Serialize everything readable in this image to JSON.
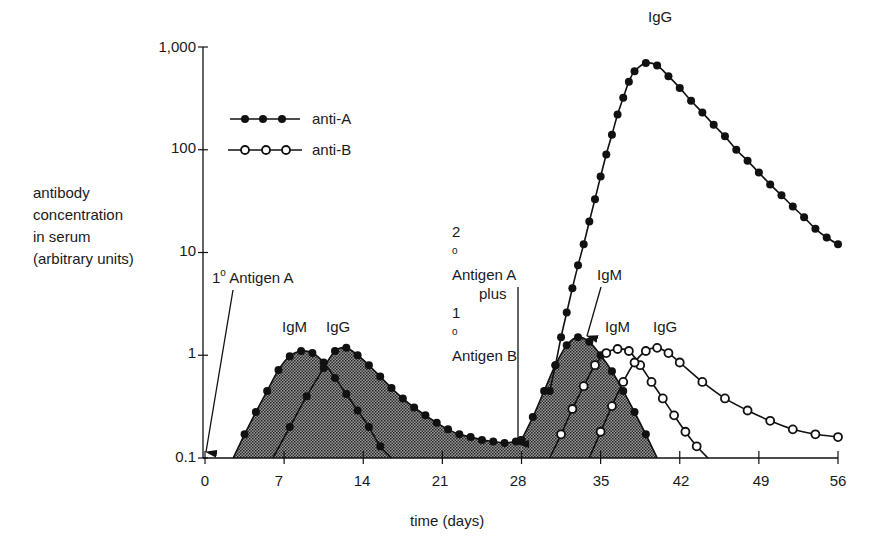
{
  "chart_data": {
    "type": "line",
    "title": "",
    "xlabel": "time (days)",
    "ylabel": "antibody concentration in serum (arbitrary units)",
    "yscale": "log",
    "ylim": [
      0.1,
      1000
    ],
    "xlim": [
      0,
      56
    ],
    "x_ticks": [
      0,
      7,
      14,
      21,
      28,
      35,
      42,
      49,
      56
    ],
    "y_ticks": [
      0.1,
      1,
      10,
      100,
      1000
    ],
    "y_tick_labels": [
      "0.1",
      "1",
      "10",
      "100",
      "1,000"
    ],
    "grid": false,
    "legend": {
      "position": "upper-left",
      "entries": [
        "anti-A",
        "anti-B"
      ]
    },
    "series": [
      {
        "name": "anti-A IgM (primary)",
        "marker": "filled-circle",
        "shaded": true,
        "points": [
          [
            2.5,
            0.1
          ],
          [
            3.5,
            0.17
          ],
          [
            4.5,
            0.28
          ],
          [
            5.5,
            0.45
          ],
          [
            6.5,
            0.72
          ],
          [
            7.5,
            0.98
          ],
          [
            8.5,
            1.1
          ],
          [
            9.5,
            1.05
          ],
          [
            10.5,
            0.85
          ],
          [
            11.5,
            0.6
          ],
          [
            12.5,
            0.42
          ],
          [
            13.5,
            0.29
          ],
          [
            14.5,
            0.2
          ],
          [
            15.5,
            0.13
          ],
          [
            16.5,
            0.1
          ]
        ]
      },
      {
        "name": "anti-A IgG (primary)",
        "marker": "filled-circle",
        "shaded": true,
        "points": [
          [
            6,
            0.1
          ],
          [
            7.5,
            0.2
          ],
          [
            9,
            0.4
          ],
          [
            10.5,
            0.75
          ],
          [
            11.5,
            1.1
          ],
          [
            12.5,
            1.18
          ],
          [
            13.5,
            1.0
          ],
          [
            14.5,
            0.8
          ],
          [
            15.5,
            0.62
          ],
          [
            16.5,
            0.48
          ],
          [
            17.5,
            0.38
          ],
          [
            18.5,
            0.31
          ],
          [
            19.5,
            0.26
          ],
          [
            20.5,
            0.22
          ],
          [
            21.5,
            0.19
          ],
          [
            22.5,
            0.17
          ],
          [
            23.5,
            0.16
          ],
          [
            24.5,
            0.15
          ],
          [
            25.5,
            0.145
          ],
          [
            26.5,
            0.14
          ],
          [
            27.5,
            0.145
          ],
          [
            28,
            0.15
          ]
        ]
      },
      {
        "name": "anti-A IgM (secondary)",
        "marker": "filled-circle",
        "shaded": true,
        "points": [
          [
            28,
            0.15
          ],
          [
            29,
            0.25
          ],
          [
            30,
            0.45
          ],
          [
            31,
            0.8
          ],
          [
            32,
            1.25
          ],
          [
            33,
            1.5
          ],
          [
            34,
            1.35
          ],
          [
            35,
            1.0
          ],
          [
            36,
            0.7
          ],
          [
            37,
            0.45
          ],
          [
            38,
            0.28
          ],
          [
            39,
            0.17
          ],
          [
            40,
            0.1
          ]
        ]
      },
      {
        "name": "anti-A IgG (secondary)",
        "marker": "filled-circle",
        "shaded": false,
        "points": [
          [
            30.5,
            0.45
          ],
          [
            31,
            0.8
          ],
          [
            31.5,
            1.5
          ],
          [
            32,
            2.6
          ],
          [
            32.5,
            4.5
          ],
          [
            33,
            7.5
          ],
          [
            33.5,
            12
          ],
          [
            34,
            20
          ],
          [
            34.5,
            33
          ],
          [
            35,
            55
          ],
          [
            35.5,
            90
          ],
          [
            36,
            140
          ],
          [
            36.5,
            220
          ],
          [
            37,
            320
          ],
          [
            37.5,
            460
          ],
          [
            38,
            580
          ],
          [
            39,
            700
          ],
          [
            40,
            660
          ],
          [
            41,
            520
          ],
          [
            42,
            400
          ],
          [
            43,
            300
          ],
          [
            44,
            230
          ],
          [
            45,
            175
          ],
          [
            46,
            135
          ],
          [
            47,
            100
          ],
          [
            48,
            78
          ],
          [
            49,
            60
          ],
          [
            50,
            46
          ],
          [
            51,
            36
          ],
          [
            52,
            28
          ],
          [
            53,
            22
          ],
          [
            54,
            17
          ],
          [
            55,
            14
          ],
          [
            56,
            12
          ]
        ]
      },
      {
        "name": "anti-B IgM (primary)",
        "marker": "open-circle",
        "shaded": false,
        "points": [
          [
            30.5,
            0.1
          ],
          [
            31.5,
            0.17
          ],
          [
            32.5,
            0.3
          ],
          [
            33.5,
            0.5
          ],
          [
            34.5,
            0.8
          ],
          [
            35.5,
            1.05
          ],
          [
            36.5,
            1.15
          ],
          [
            37.5,
            1.1
          ],
          [
            38.5,
            0.8
          ],
          [
            39.5,
            0.55
          ],
          [
            40.5,
            0.38
          ],
          [
            41.5,
            0.26
          ],
          [
            42.5,
            0.18
          ],
          [
            43.5,
            0.13
          ],
          [
            44.5,
            0.1
          ]
        ]
      },
      {
        "name": "anti-B IgG (primary)",
        "marker": "open-circle",
        "shaded": false,
        "points": [
          [
            34,
            0.1
          ],
          [
            35,
            0.18
          ],
          [
            36,
            0.32
          ],
          [
            37,
            0.55
          ],
          [
            38,
            0.85
          ],
          [
            39,
            1.1
          ],
          [
            40,
            1.18
          ],
          [
            41,
            1.05
          ],
          [
            42,
            0.85
          ],
          [
            44,
            0.55
          ],
          [
            46,
            0.38
          ],
          [
            48,
            0.29
          ],
          [
            50,
            0.23
          ],
          [
            52,
            0.19
          ],
          [
            54,
            0.17
          ],
          [
            56,
            0.16
          ]
        ]
      }
    ],
    "annotations": [
      {
        "text": "1° Antigen A",
        "x": 0,
        "arrow_to": [
          0,
          0.1
        ]
      },
      {
        "text": "2° Antigen A plus 1° Antigen B",
        "x": 28,
        "arrow_to": [
          28,
          0.15
        ]
      },
      {
        "text": "IgM",
        "at": [
          8,
          1.4
        ]
      },
      {
        "text": "IgG",
        "at": [
          12.5,
          1.4
        ]
      },
      {
        "text": "IgM",
        "at": [
          35,
          3
        ],
        "arrow_to": [
          33,
          1.6
        ]
      },
      {
        "text": "IgM",
        "at": [
          37,
          1.4
        ]
      },
      {
        "text": "IgG",
        "at": [
          40.5,
          1.4
        ]
      },
      {
        "text": "IgG",
        "at": [
          39.5,
          1000
        ]
      }
    ]
  },
  "axes": {
    "y_ticks": [
      {
        "label": "1,000",
        "top": 38
      },
      {
        "label": "100",
        "top": 139
      },
      {
        "label": "10",
        "top": 242
      },
      {
        "label": "1",
        "top": 344
      },
      {
        "label": "0.1",
        "top": 448
      }
    ],
    "x_ticks": [
      {
        "label": "0",
        "left": 185
      },
      {
        "label": "7",
        "left": 259
      },
      {
        "label": "14",
        "left": 342
      },
      {
        "label": "21",
        "left": 420
      },
      {
        "label": "28",
        "left": 498
      },
      {
        "label": "35",
        "left": 581
      },
      {
        "label": "42",
        "left": 661
      },
      {
        "label": "49",
        "left": 741
      },
      {
        "label": "56",
        "left": 818
      }
    ],
    "xlabel": "time (days)",
    "ylabel_lines": [
      "antibody",
      "concentration",
      "in serum",
      "(arbitrary units)"
    ]
  },
  "legend": {
    "anti_a": "anti-A",
    "anti_b": "anti-B"
  },
  "annotations": {
    "primary_a_sup": "1",
    "primary_a_deg": "o",
    "primary_a_text": " Antigen A",
    "secondary_line1_num": "2",
    "secondary_line1_text": " Antigen A",
    "secondary_line2": "plus",
    "secondary_line3_num": "1",
    "secondary_line3_text": " Antigen B",
    "igm1": "IgM",
    "igg1": "IgG",
    "igm2": "IgM",
    "igm3": "IgM",
    "igg3": "IgG",
    "igg_peak": "IgG"
  }
}
